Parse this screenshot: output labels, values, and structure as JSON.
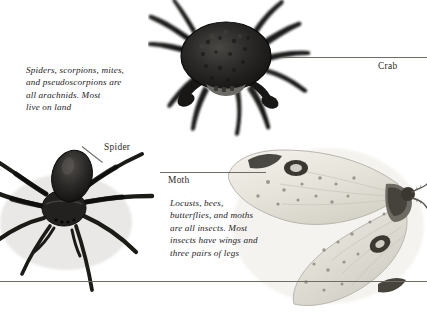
{
  "page": {
    "background_color": "#ffffff",
    "text_color": "#25231f",
    "rule_color": "#6f6c66"
  },
  "captions": {
    "arachnid": "Spiders, scorpions, mites,\nand pseudoscorpions are\nall arachnids. Most\nlive on land",
    "insect": "Locusts, bees,\nbutterflies, and moths\nare all insects. Most\ninsects have wings and\nthree pairs of legs"
  },
  "labels": {
    "crab": "Crab",
    "spider": "Spider",
    "moth": "Moth"
  },
  "specimens": [
    {
      "name": "crab",
      "label": "Crab",
      "description": "Dark textured crab seen from above with eight walking legs and two front claws",
      "body_color": "#232323",
      "group": "crustacean"
    },
    {
      "name": "spider",
      "label": "Spider",
      "description": "Dark hairy wolf spider seen from above with eight long legs",
      "body_color": "#2b2b2b",
      "group": "arachnid"
    },
    {
      "name": "moth",
      "label": "Moth",
      "description": "Pale cream moth with dark eyespot markings on the wings and feathered antennae",
      "body_color": "#e9e7e0",
      "group": "insect"
    }
  ]
}
